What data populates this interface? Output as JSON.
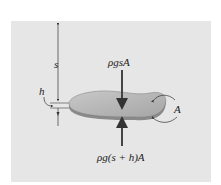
{
  "diagram": {
    "type": "free-body diagram of a thin submerged slab",
    "labels": {
      "depth": "s",
      "thickness": "h",
      "area": "A",
      "top_force": "ρgsA",
      "bottom_force": "ρg(s + h)A"
    },
    "colors": {
      "background": "#e6e6e6",
      "slab_top": "#b3b3b3",
      "slab_edge": "#8a8a8a",
      "arrows": "#444444",
      "lines": "#333333"
    }
  }
}
